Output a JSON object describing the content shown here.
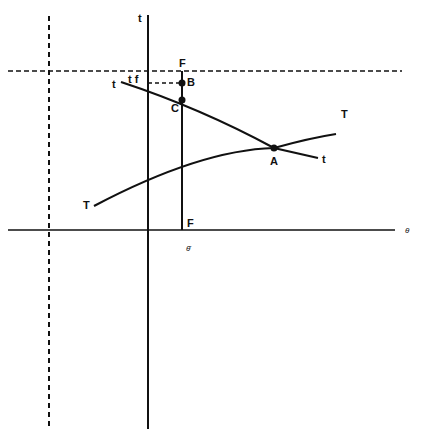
{
  "diagram": {
    "colors": {
      "ink": "#111111",
      "background": "#ffffff"
    },
    "axes": {
      "vertical_axis_label": "t",
      "horizontal_axis_label": "θ",
      "theta_bar_label": "θ̄"
    },
    "curves": {
      "t_curve": {
        "label_start": "t",
        "label_end": "t"
      },
      "T_curve": {
        "label_start": "T",
        "label_end": "T"
      }
    },
    "points": {
      "A": "A",
      "B": "B",
      "C": "C"
    },
    "labels": {
      "F_top": "F",
      "F_bottom": "F",
      "tf": "t f"
    }
  }
}
